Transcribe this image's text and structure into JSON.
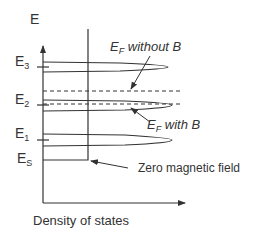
{
  "axes": {
    "y_label": "E",
    "x_label": "Density of states"
  },
  "levels": [
    {
      "name": "E",
      "sub": "3"
    },
    {
      "name": "E",
      "sub": "2"
    },
    {
      "name": "E",
      "sub": "1"
    },
    {
      "name": "E",
      "sub": "S"
    }
  ],
  "annotations": {
    "ef_without_b": {
      "main": "E",
      "sub": "F",
      "rest": " without B"
    },
    "ef_with_b": {
      "main": "E",
      "sub": "F",
      "rest": " with B"
    },
    "zero_field": "Zero magnetic field"
  },
  "colors": {
    "line": "#333333",
    "background": "#ffffff"
  }
}
